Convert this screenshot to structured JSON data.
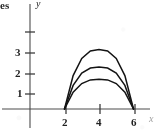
{
  "figure": {
    "corner_text": "es",
    "x_axis_label": "x",
    "y_axis_label": "y"
  },
  "chart_data": {
    "type": "line",
    "title": "",
    "xlabel": "x",
    "ylabel": "y",
    "xlim": [
      -0.6,
      7.4
    ],
    "ylim": [
      -0.5,
      4.4
    ],
    "grid": false,
    "legend": "none",
    "x_ticks": [
      2,
      4,
      6
    ],
    "x_tick_labels": [
      "2",
      "4",
      "6"
    ],
    "y_ticks": [
      1,
      2,
      3,
      4
    ],
    "y_tick_labels": [
      "1",
      "2",
      "3",
      ""
    ],
    "annotations": [
      "es"
    ],
    "series": [
      {
        "name": "arc-outer",
        "description": "parabolic arc from x=2 to x=6 with peak height 2.9 at x=4",
        "x_start": 2,
        "x_end": 6,
        "peak_x": 4,
        "peak_y": 2.9,
        "x": [
          2.0,
          2.5,
          3.0,
          3.5,
          4.0,
          4.5,
          5.0,
          5.5,
          6.0
        ],
        "values": [
          0.0,
          1.63,
          2.47,
          2.83,
          2.9,
          2.83,
          2.47,
          1.63,
          0.0
        ]
      },
      {
        "name": "arc-middle",
        "description": "parabolic arc from x=2 to x=6 with peak height 2.05 at x=4",
        "x_start": 2,
        "x_end": 6,
        "peak_x": 4,
        "peak_y": 2.05,
        "x": [
          2.0,
          2.5,
          3.0,
          3.5,
          4.0,
          4.5,
          5.0,
          5.5,
          6.0
        ],
        "values": [
          0.0,
          1.15,
          1.75,
          2.0,
          2.05,
          2.0,
          1.75,
          1.15,
          0.0
        ]
      },
      {
        "name": "arc-inner",
        "description": "parabolic arc from x=2 to x=6 with peak height 1.45 at x=4",
        "x_start": 2,
        "x_end": 6,
        "peak_x": 4,
        "peak_y": 1.45,
        "x": [
          2.0,
          2.5,
          3.0,
          3.5,
          4.0,
          4.5,
          5.0,
          5.5,
          6.0
        ],
        "values": [
          0.0,
          0.82,
          1.24,
          1.42,
          1.45,
          1.42,
          1.24,
          0.82,
          0.0
        ]
      }
    ]
  },
  "tick_labels": {
    "y3": "3",
    "y2": "2",
    "y1": "1",
    "x2": "2",
    "x4": "4",
    "x6": "6"
  }
}
